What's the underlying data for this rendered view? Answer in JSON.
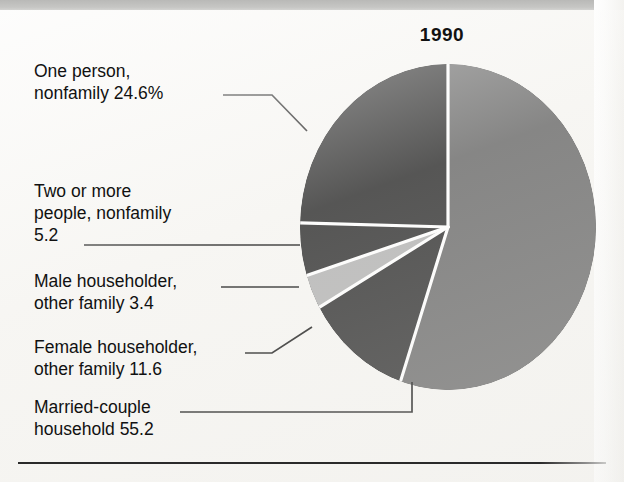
{
  "chart_title": "1990",
  "chart_data": {
    "type": "pie",
    "title": "1990",
    "subtitle": "",
    "xlabel": "",
    "ylabel": "",
    "units": "percent",
    "total": 100.0,
    "legend_position": "callout-labels-left",
    "grid": false,
    "start_angle_deg": 0,
    "direction": "clockwise",
    "categories": [
      "Married-couple household",
      "Female householder, other family",
      "Male householder, other family",
      "Two or more people, nonfamily",
      "One person, nonfamily"
    ],
    "values": [
      55.2,
      11.6,
      3.4,
      5.2,
      24.6
    ],
    "value_labels": [
      "55.2",
      "11.6",
      "3.4",
      "5.2",
      "24.6%"
    ],
    "colors": [
      "#6a6a6a",
      "#2e2e2e",
      "#b2b2b2",
      "#2e2e2e",
      "#2e2e2e"
    ],
    "slice_separator_color": "#ffffff",
    "slices": [
      {
        "name": "Married-couple household",
        "value": 55.2,
        "value_label": "55.2",
        "color": "#6a6a6a"
      },
      {
        "name": "Female householder, other family",
        "value": 11.6,
        "value_label": "11.6",
        "color": "#2e2e2e"
      },
      {
        "name": "Male householder, other family",
        "value": 3.4,
        "value_label": "3.4",
        "color": "#b2b2b2"
      },
      {
        "name": "Two or more people, nonfamily",
        "value": 5.2,
        "value_label": "5.2",
        "color": "#2e2e2e"
      },
      {
        "name": "One person, nonfamily",
        "value": 24.6,
        "value_label": "24.6%",
        "color": "#2e2e2e"
      }
    ]
  },
  "labels": {
    "one_person": {
      "line1": "One person,",
      "line2": "nonfamily  24.6%"
    },
    "two_or_more": {
      "line1": "Two or more",
      "line2": "people, nonfamily",
      "line3": "5.2"
    },
    "male_householder": {
      "line1": "Male householder,",
      "line2": "other family  3.4"
    },
    "female_householder": {
      "line1": "Female householder,",
      "line2": "other family  11.6"
    },
    "married_couple": {
      "line1": "Married-couple",
      "line2": "household  55.2"
    }
  },
  "colors": {
    "paper": "#f7f6f3",
    "ink": "#111111",
    "slice_large": "#6a6a6a",
    "slice_dark": "#2e2e2e",
    "slice_light": "#b2b2b2",
    "separator": "#ffffff",
    "rule": "#2a2a2a"
  }
}
